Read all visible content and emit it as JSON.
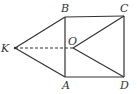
{
  "diagram": {
    "points": {
      "K": {
        "label": "K",
        "x": 15,
        "y": 48
      },
      "B": {
        "label": "B",
        "x": 65,
        "y": 17
      },
      "C": {
        "label": "C",
        "x": 124,
        "y": 16
      },
      "O": {
        "label": "O",
        "x": 73,
        "y": 48
      },
      "A": {
        "label": "A",
        "x": 65,
        "y": 77
      },
      "D": {
        "label": "D",
        "x": 124,
        "y": 77
      }
    },
    "segments": [
      {
        "from": "K",
        "to": "B",
        "style": "solid"
      },
      {
        "from": "K",
        "to": "A",
        "style": "solid"
      },
      {
        "from": "K",
        "to": "O",
        "style": "dashed"
      },
      {
        "from": "B",
        "to": "C",
        "style": "solid"
      },
      {
        "from": "C",
        "to": "D",
        "style": "solid"
      },
      {
        "from": "D",
        "to": "A",
        "style": "solid"
      },
      {
        "from": "A",
        "to": "B",
        "style": "solid"
      },
      {
        "from": "O",
        "to": "C",
        "style": "solid"
      },
      {
        "from": "O",
        "to": "D",
        "style": "solid"
      }
    ],
    "colors": {
      "line": "#333333",
      "background": "#ffffff"
    }
  }
}
